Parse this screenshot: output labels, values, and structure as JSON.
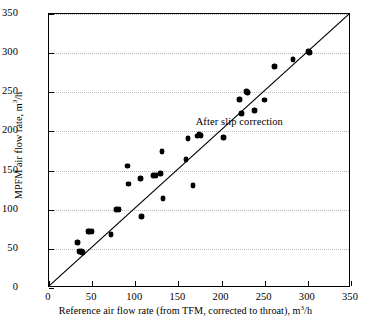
{
  "chart_data": {
    "type": "scatter",
    "title": "",
    "xlabel": "Reference air flow rate (from TFM, corrected to throat), m³/h",
    "xlabel_parts": {
      "before": "Reference air flow rate (from TFM, corrected to throat), m",
      "sup": "3",
      "after": "/h"
    },
    "ylabel": "MPFM air flow rate, m³/h",
    "ylabel_parts": {
      "before": "MPFM air flow rate, m",
      "sup": "3",
      "after": "/h"
    },
    "xlim": [
      0,
      350
    ],
    "ylim": [
      0,
      350
    ],
    "xticks": [
      0,
      50,
      100,
      150,
      200,
      250,
      300,
      350
    ],
    "yticks": [
      0,
      50,
      100,
      150,
      200,
      250,
      300,
      350
    ],
    "grid": "horizontal-dotted",
    "grid_color": "#b9b9b9",
    "legend": "none",
    "marker": "filled-diamond",
    "marker_color": "#000000",
    "reference_line": {
      "label": "y = x (1:1 parity line)",
      "from": [
        0,
        0
      ],
      "to": [
        350,
        350
      ],
      "style": "solid",
      "color": "#000000"
    },
    "annotations": [
      {
        "text": "After slip correction",
        "x": 170,
        "y": 212
      }
    ],
    "points": [
      [
        33,
        58
      ],
      [
        35,
        47
      ],
      [
        36,
        46
      ],
      [
        38,
        47
      ],
      [
        39,
        45
      ],
      [
        45,
        72
      ],
      [
        47,
        72
      ],
      [
        50,
        72
      ],
      [
        72,
        68
      ],
      [
        78,
        100
      ],
      [
        81,
        100
      ],
      [
        91,
        156
      ],
      [
        92,
        133
      ],
      [
        106,
        140
      ],
      [
        107,
        91
      ],
      [
        121,
        144
      ],
      [
        124,
        144
      ],
      [
        129,
        146
      ],
      [
        131,
        174
      ],
      [
        132,
        114
      ],
      [
        159,
        164
      ],
      [
        161,
        191
      ],
      [
        167,
        131
      ],
      [
        172,
        194
      ],
      [
        174,
        196
      ],
      [
        176,
        195
      ],
      [
        202,
        192
      ],
      [
        221,
        241
      ],
      [
        223,
        223
      ],
      [
        229,
        251
      ],
      [
        230,
        250
      ],
      [
        238,
        227
      ],
      [
        250,
        240
      ],
      [
        261,
        283
      ],
      [
        283,
        292
      ],
      [
        301,
        302
      ],
      [
        302,
        301
      ]
    ]
  },
  "axes": {
    "xtick_labels": [
      "0",
      "50",
      "100",
      "150",
      "200",
      "250",
      "300",
      "350"
    ],
    "ytick_labels": [
      "0",
      "50",
      "100",
      "150",
      "200",
      "250",
      "300",
      "350"
    ]
  }
}
